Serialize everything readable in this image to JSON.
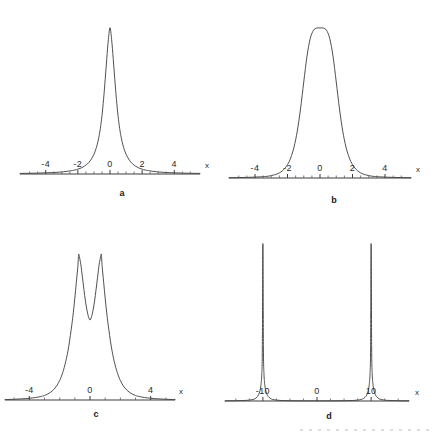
{
  "figure": {
    "title": "",
    "background_color": "#ffffff",
    "curve_color": "#3c3c3c",
    "axis_color": "#3c3c3c",
    "text_color": "#2b2b2b",
    "panel_count": 4
  },
  "panels": [
    {
      "letter": "a",
      "axis_name": "x",
      "tick_labels": [
        "-4",
        "-2",
        "0",
        "2",
        "4"
      ],
      "tick_values": [
        -4,
        -2,
        0,
        2,
        4
      ]
    },
    {
      "letter": "b",
      "axis_name": "x",
      "tick_labels": [
        "-4",
        "-2",
        "0",
        "2",
        "4"
      ],
      "tick_values": [
        -4,
        -2,
        0,
        2,
        4
      ]
    },
    {
      "letter": "c",
      "axis_name": "x",
      "tick_labels": [
        "-4",
        "0",
        "4"
      ],
      "tick_values": [
        -4,
        0,
        4
      ]
    },
    {
      "letter": "d",
      "axis_name": "x",
      "tick_labels": [
        "-10",
        "0",
        "10"
      ],
      "tick_values": [
        -10,
        0,
        10
      ]
    }
  ],
  "chart_data": [
    {
      "type": "line",
      "panel": "a",
      "title": "a",
      "xlabel": "x",
      "ylabel": "",
      "xlim": [
        -5.6,
        5.6
      ],
      "ylim": [
        0,
        1.08
      ],
      "grid": false,
      "legend": "none",
      "description": "single narrow symmetric peak centred at x = 0, sharp cusp-like maximum with long low tails",
      "curve_form": "lorentzian-like narrow peak, half-width about 0.35",
      "x": [
        -5.6,
        -5.0,
        -4.5,
        -4.0,
        -3.5,
        -3.0,
        -2.5,
        -2.2,
        -2.0,
        -1.8,
        -1.6,
        -1.4,
        -1.2,
        -1.0,
        -0.9,
        -0.8,
        -0.7,
        -0.6,
        -0.5,
        -0.4,
        -0.3,
        -0.2,
        -0.1,
        0.0,
        0.1,
        0.2,
        0.3,
        0.4,
        0.5,
        0.6,
        0.7,
        0.8,
        0.9,
        1.0,
        1.2,
        1.4,
        1.6,
        1.8,
        2.0,
        2.2,
        2.5,
        3.0,
        3.5,
        4.0,
        4.5,
        5.0,
        5.6
      ],
      "y": [
        0.004,
        0.005,
        0.006,
        0.008,
        0.01,
        0.014,
        0.021,
        0.027,
        0.033,
        0.041,
        0.053,
        0.07,
        0.095,
        0.135,
        0.163,
        0.199,
        0.248,
        0.312,
        0.398,
        0.51,
        0.645,
        0.79,
        0.92,
        1.0,
        0.92,
        0.79,
        0.645,
        0.51,
        0.398,
        0.312,
        0.248,
        0.199,
        0.163,
        0.135,
        0.095,
        0.07,
        0.053,
        0.041,
        0.033,
        0.027,
        0.021,
        0.014,
        0.01,
        0.008,
        0.006,
        0.005,
        0.004
      ]
    },
    {
      "type": "line",
      "panel": "b",
      "title": "b",
      "xlabel": "x",
      "ylabel": "",
      "xlim": [
        -5.6,
        5.6
      ],
      "ylim": [
        0,
        1.08
      ],
      "grid": false,
      "legend": "none",
      "description": "single broad symmetric peak centred at x = 0 with a slightly flattened rounded top and steep flanks",
      "curve_form": "super-gaussian, flattened crest, half-width about 0.85",
      "x": [
        -5.6,
        -5.0,
        -4.5,
        -4.0,
        -3.5,
        -3.2,
        -3.0,
        -2.8,
        -2.6,
        -2.4,
        -2.2,
        -2.0,
        -1.8,
        -1.6,
        -1.4,
        -1.2,
        -1.0,
        -0.8,
        -0.6,
        -0.4,
        -0.2,
        0.0,
        0.2,
        0.4,
        0.6,
        0.8,
        1.0,
        1.2,
        1.4,
        1.6,
        1.8,
        2.0,
        2.2,
        2.4,
        2.6,
        2.8,
        3.0,
        3.2,
        3.5,
        4.0,
        4.5,
        5.0,
        5.6
      ],
      "y": [
        0.002,
        0.003,
        0.004,
        0.006,
        0.009,
        0.012,
        0.016,
        0.021,
        0.029,
        0.041,
        0.06,
        0.089,
        0.135,
        0.206,
        0.312,
        0.46,
        0.64,
        0.812,
        0.93,
        0.985,
        1.0,
        1.0,
        1.0,
        0.985,
        0.93,
        0.812,
        0.64,
        0.46,
        0.312,
        0.206,
        0.135,
        0.089,
        0.06,
        0.041,
        0.029,
        0.021,
        0.016,
        0.012,
        0.009,
        0.006,
        0.004,
        0.003,
        0.002
      ]
    },
    {
      "type": "line",
      "panel": "c",
      "title": "c",
      "xlabel": "x",
      "ylabel": "",
      "xlim": [
        -5.6,
        5.6
      ],
      "ylim": [
        0,
        1.08
      ],
      "grid": false,
      "legend": "none",
      "description": "symmetric double peak (two maxima) separated by a V-shaped central dip at x = 0; outer flanks fall to near zero",
      "curve_form": "two maxima near x = -0.75 and x = +0.75 with central minimum at 0 of about 0.55 of peak height",
      "x": [
        -5.6,
        -5.0,
        -4.5,
        -4.0,
        -3.6,
        -3.2,
        -3.0,
        -2.8,
        -2.6,
        -2.4,
        -2.2,
        -2.0,
        -1.8,
        -1.6,
        -1.4,
        -1.2,
        -1.1,
        -1.0,
        -0.9,
        -0.8,
        -0.75,
        -0.7,
        -0.6,
        -0.5,
        -0.4,
        -0.3,
        -0.2,
        -0.1,
        0.0,
        0.1,
        0.2,
        0.3,
        0.4,
        0.5,
        0.6,
        0.7,
        0.75,
        0.8,
        0.9,
        1.0,
        1.1,
        1.2,
        1.4,
        1.6,
        1.8,
        2.0,
        2.2,
        2.4,
        2.6,
        2.8,
        3.0,
        3.2,
        3.6,
        4.0,
        4.5,
        5.0,
        5.6
      ],
      "y": [
        0.003,
        0.005,
        0.008,
        0.012,
        0.017,
        0.025,
        0.031,
        0.04,
        0.053,
        0.071,
        0.097,
        0.134,
        0.188,
        0.264,
        0.37,
        0.515,
        0.6,
        0.7,
        0.81,
        0.92,
        1.0,
        0.985,
        0.93,
        0.845,
        0.76,
        0.68,
        0.618,
        0.573,
        0.55,
        0.573,
        0.618,
        0.68,
        0.76,
        0.845,
        0.93,
        0.985,
        1.0,
        0.92,
        0.81,
        0.7,
        0.6,
        0.515,
        0.37,
        0.264,
        0.188,
        0.134,
        0.097,
        0.071,
        0.053,
        0.04,
        0.031,
        0.025,
        0.017,
        0.012,
        0.008,
        0.005,
        0.003
      ]
    },
    {
      "type": "line",
      "panel": "d",
      "title": "d",
      "xlabel": "x",
      "ylabel": "",
      "xlim": [
        -17.0,
        17.0
      ],
      "ylim": [
        0,
        1.08
      ],
      "grid": false,
      "legend": "none",
      "description": "two extremely narrow symmetric spikes centred at x = -10 and x = +10; the curve is essentially zero elsewhere including at x = 0",
      "curve_form": "pair of very narrow lorentzian spikes, half-width about 0.25, located at +/- 10",
      "peak_positions": [
        -10,
        10
      ],
      "x": [
        -17.0,
        -15.0,
        -14.0,
        -13.0,
        -12.5,
        -12.0,
        -11.6,
        -11.3,
        -11.1,
        -10.9,
        -10.7,
        -10.5,
        -10.4,
        -10.3,
        -10.2,
        -10.1,
        -10.0,
        -9.9,
        -9.8,
        -9.7,
        -9.6,
        -9.5,
        -9.3,
        -9.1,
        -8.9,
        -8.6,
        -8.2,
        -7.5,
        -6.5,
        -5.0,
        -3.0,
        -1.0,
        0.0,
        1.0,
        3.0,
        5.0,
        6.5,
        7.5,
        8.2,
        8.6,
        8.9,
        9.1,
        9.3,
        9.5,
        9.6,
        9.7,
        9.8,
        9.9,
        10.0,
        10.1,
        10.2,
        10.3,
        10.4,
        10.5,
        10.7,
        10.9,
        11.1,
        11.3,
        11.6,
        12.0,
        12.5,
        13.0,
        14.0,
        15.0,
        17.0
      ],
      "y": [
        0.001,
        0.002,
        0.003,
        0.004,
        0.006,
        0.008,
        0.012,
        0.018,
        0.024,
        0.033,
        0.047,
        0.07,
        0.09,
        0.12,
        0.175,
        0.33,
        1.0,
        0.33,
        0.175,
        0.12,
        0.09,
        0.07,
        0.047,
        0.033,
        0.024,
        0.016,
        0.01,
        0.006,
        0.003,
        0.002,
        0.001,
        0.001,
        0.001,
        0.001,
        0.001,
        0.002,
        0.003,
        0.006,
        0.01,
        0.016,
        0.024,
        0.033,
        0.047,
        0.07,
        0.09,
        0.12,
        0.175,
        0.33,
        1.0,
        0.33,
        0.175,
        0.12,
        0.09,
        0.07,
        0.047,
        0.033,
        0.024,
        0.018,
        0.012,
        0.008,
        0.006,
        0.004,
        0.003,
        0.002,
        0.001
      ]
    }
  ]
}
